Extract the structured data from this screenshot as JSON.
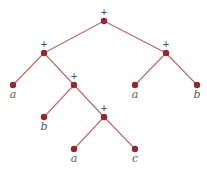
{
  "diagram": {
    "type": "expression-tree",
    "colors": {
      "node": "#8e2a33",
      "edge": "#b86a6a",
      "operator_text": "#333333",
      "leaf_text": "#555a66"
    },
    "nodes": [
      {
        "id": "root",
        "label": "+",
        "kind": "operator",
        "x": 104,
        "y": 21
      },
      {
        "id": "l",
        "label": "+",
        "kind": "operator",
        "x": 44,
        "y": 53
      },
      {
        "id": "r",
        "label": "+",
        "kind": "operator",
        "x": 166,
        "y": 53
      },
      {
        "id": "la",
        "label": "a",
        "kind": "leaf",
        "x": 13,
        "y": 85
      },
      {
        "id": "lm",
        "label": "+",
        "kind": "operator",
        "x": 74,
        "y": 85
      },
      {
        "id": "ra",
        "label": "a",
        "kind": "leaf",
        "x": 135,
        "y": 85
      },
      {
        "id": "rb",
        "label": "b",
        "kind": "leaf",
        "x": 197,
        "y": 85
      },
      {
        "id": "lmb",
        "label": "b",
        "kind": "leaf",
        "x": 44,
        "y": 117
      },
      {
        "id": "lmp",
        "label": "+",
        "kind": "operator",
        "x": 104,
        "y": 117
      },
      {
        "id": "lmpa",
        "label": "a",
        "kind": "leaf",
        "x": 74,
        "y": 149
      },
      {
        "id": "lmpc",
        "label": "c",
        "kind": "leaf",
        "x": 135,
        "y": 149
      }
    ],
    "edges": [
      [
        "root",
        "l"
      ],
      [
        "root",
        "r"
      ],
      [
        "l",
        "la"
      ],
      [
        "l",
        "lm"
      ],
      [
        "r",
        "ra"
      ],
      [
        "r",
        "rb"
      ],
      [
        "lm",
        "lmb"
      ],
      [
        "lm",
        "lmp"
      ],
      [
        "lmp",
        "lmpa"
      ],
      [
        "lmp",
        "lmpc"
      ]
    ]
  }
}
